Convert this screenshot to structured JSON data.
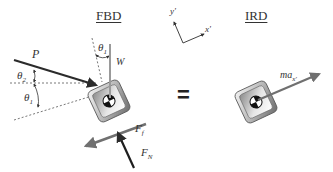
{
  "titles": {
    "fbd": "FBD",
    "ird": "IRD"
  },
  "axes": {
    "x_label": "x'",
    "y_label": "y'"
  },
  "fbd": {
    "force_p": "P",
    "force_w": "W",
    "force_friction": "F",
    "force_friction_sub": "f",
    "force_normal": "F",
    "force_normal_sub": "N",
    "angle_1_top": "θ",
    "angle_1_top_sub": "1",
    "angle_2": "θ",
    "angle_2_sub": "2",
    "angle_1_left": "θ",
    "angle_1_left_sub": "1"
  },
  "equals": "=",
  "ird": {
    "inertial_force": "ma",
    "inertial_force_sub": "x'"
  },
  "colors": {
    "arrow_dark": "#2b2b2b",
    "arrow_gray": "#707070",
    "weight_line": "#9a9a9a",
    "dashed": "#555555",
    "block_outer": "#8c8c8c",
    "block_inner": "#d9d9d9"
  }
}
